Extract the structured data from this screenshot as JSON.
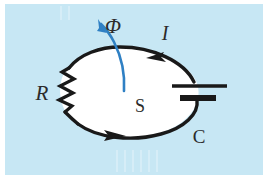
{
  "figure": {
    "kind": "physics-circuit-diagram",
    "background_color": "#c7e7f4",
    "frame_color": "#ffffff",
    "wire_color": "#191919",
    "fill_color": "#ffffff",
    "flux_arrow_color": "#2f80c4",
    "labels": {
      "flux": "Φ",
      "current": "I",
      "surface": "S",
      "resistor": "R",
      "capacitor": "C"
    },
    "components": [
      {
        "name": "resistor",
        "label": "R",
        "position": "left",
        "zigzag_peaks": 7
      },
      {
        "name": "capacitor",
        "label": "C",
        "position": "right",
        "plates": 2
      },
      {
        "name": "current-arrow-top",
        "label": "I",
        "direction": "counterclockwise"
      },
      {
        "name": "current-arrow-bottom",
        "label": "I",
        "direction": "counterclockwise"
      },
      {
        "name": "flux-arrow",
        "label": "Φ",
        "direction": "up-left",
        "color": "#2f80c4"
      },
      {
        "name": "surface-label",
        "label": "S"
      }
    ]
  }
}
